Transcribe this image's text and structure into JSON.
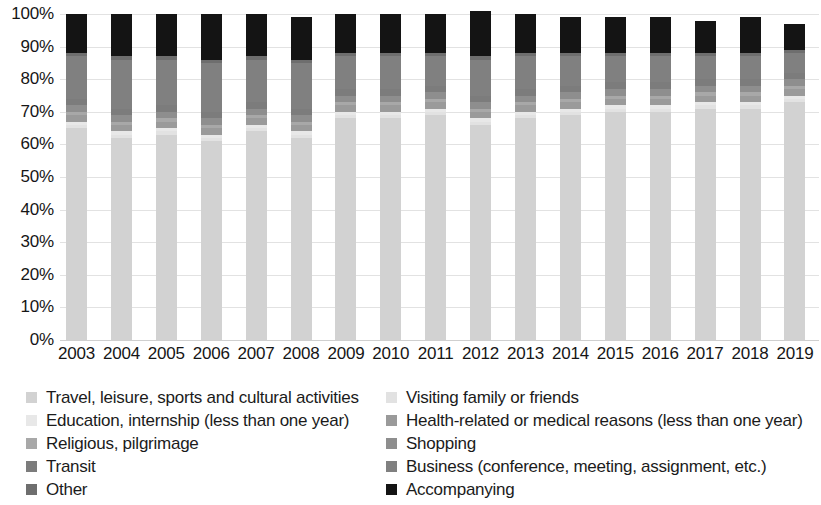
{
  "chart_data": {
    "type": "bar",
    "subtype": "stacked-100-percent",
    "title": "",
    "xlabel": "",
    "ylabel": "",
    "ylim": [
      0,
      100
    ],
    "grid": true,
    "legend_position": "bottom",
    "y_ticks": [
      "0%",
      "10%",
      "20%",
      "30%",
      "40%",
      "50%",
      "60%",
      "70%",
      "80%",
      "90%",
      "100%"
    ],
    "y_tick_values": [
      0,
      10,
      20,
      30,
      40,
      50,
      60,
      70,
      80,
      90,
      100
    ],
    "categories": [
      "2003",
      "2004",
      "2005",
      "2006",
      "2007",
      "2008",
      "2009",
      "2010",
      "2011",
      "2012",
      "2013",
      "2014",
      "2015",
      "2016",
      "2017",
      "2018",
      "2019"
    ],
    "series": [
      {
        "name": "Travel, leisure, sports and cultural activities",
        "color": "#d2d2d2",
        "values": [
          65,
          62,
          63,
          61,
          64,
          62,
          68,
          68,
          69,
          66,
          68,
          69,
          70,
          70,
          71,
          71,
          73
        ]
      },
      {
        "name": "Visiting family or friends",
        "color": "#e2e2e2",
        "values": [
          1,
          1,
          1,
          1,
          1,
          1,
          1,
          1,
          1,
          1,
          1,
          1,
          1,
          1,
          1,
          1,
          1
        ]
      },
      {
        "name": "Education, internship (less than one year)",
        "color": "#e8e8e8",
        "values": [
          1,
          1,
          1,
          1,
          1,
          1,
          1,
          1,
          1,
          1,
          1,
          1,
          1,
          1,
          1,
          1,
          1
        ]
      },
      {
        "name": "Health-related or medical reasons (less than one year)",
        "color": "#9a9a9a",
        "values": [
          2,
          2,
          2,
          2,
          2,
          2,
          2,
          2,
          2,
          2,
          2,
          2,
          2,
          2,
          2,
          2,
          2
        ]
      },
      {
        "name": "Religious, pilgrimage",
        "color": "#a8a8a8",
        "values": [
          1,
          1,
          1,
          1,
          1,
          1,
          1,
          1,
          1,
          1,
          1,
          1,
          1,
          1,
          1,
          1,
          1
        ]
      },
      {
        "name": "Shopping",
        "color": "#8e8e8e",
        "values": [
          2,
          2,
          2,
          2,
          2,
          2,
          2,
          2,
          2,
          2,
          2,
          2,
          2,
          2,
          2,
          2,
          2
        ]
      },
      {
        "name": "Transit",
        "color": "#7c7c7c",
        "values": [
          2,
          2,
          2,
          2,
          2,
          2,
          2,
          2,
          2,
          2,
          2,
          2,
          2,
          2,
          2,
          2,
          2
        ]
      },
      {
        "name": "Business (conference, meeting, assignment, etc.)",
        "color": "#808080",
        "values": [
          13,
          15,
          14,
          15,
          13,
          14,
          10,
          10,
          9,
          11,
          10,
          9,
          8,
          8,
          7,
          7,
          6
        ]
      },
      {
        "name": "Other",
        "color": "#6e6e6e",
        "values": [
          1,
          1,
          1,
          1,
          1,
          1,
          1,
          1,
          1,
          1,
          1,
          1,
          1,
          1,
          1,
          1,
          1
        ]
      },
      {
        "name": "Accompanying",
        "color": "#141414",
        "values": [
          12,
          13,
          13,
          14,
          13,
          13,
          12,
          12,
          12,
          14,
          12,
          11,
          11,
          11,
          10,
          11,
          8
        ]
      }
    ]
  },
  "legend": {
    "left_column": [
      {
        "label": "Travel, leisure, sports and cultural activities",
        "color": "#d2d2d2"
      },
      {
        "label": "Education, internship (less than one year)",
        "color": "#e8e8e8"
      },
      {
        "label": "Religious, pilgrimage",
        "color": "#a8a8a8"
      },
      {
        "label": "Transit",
        "color": "#7c7c7c"
      },
      {
        "label": "Other",
        "color": "#6e6e6e"
      }
    ],
    "right_column": [
      {
        "label": "Visiting family or friends",
        "color": "#e2e2e2"
      },
      {
        "label": "Health-related or medical reasons (less than one year)",
        "color": "#9a9a9a"
      },
      {
        "label": "Shopping",
        "color": "#8e8e8e"
      },
      {
        "label": "Business (conference, meeting, assignment, etc.)",
        "color": "#808080"
      },
      {
        "label": "Accompanying",
        "color": "#141414"
      }
    ]
  }
}
